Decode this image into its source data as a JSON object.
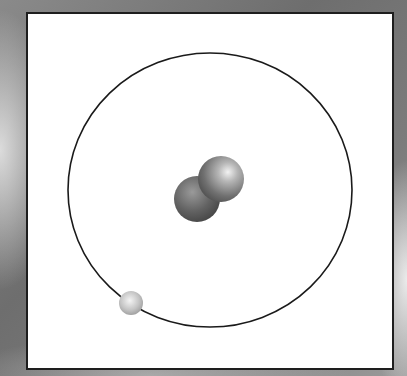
{
  "diagram": {
    "panel": {
      "background": "#ffffff",
      "border": "#1e1e1e"
    },
    "orbit": {
      "cx": 210,
      "cy": 190,
      "rx": 142,
      "ry": 137,
      "stroke": "#1a1a1a"
    },
    "nucleus": {
      "particles": [
        {
          "kind": "neutron",
          "cx": 197,
          "cy": 199,
          "r": 23,
          "color": "#6a6a6a"
        },
        {
          "kind": "proton",
          "cx": 221,
          "cy": 179,
          "r": 23,
          "color": "#8c8c8c"
        }
      ]
    },
    "electrons": [
      {
        "kind": "electron",
        "cx": 131,
        "cy": 303,
        "r": 12,
        "color": "#c8c8c8"
      }
    ]
  }
}
